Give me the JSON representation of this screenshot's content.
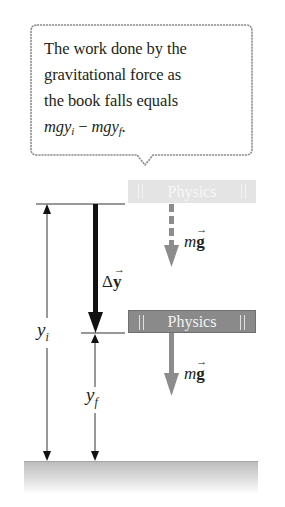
{
  "callout": {
    "line1": "The work done by the",
    "line2": "gravitational force as",
    "line3": "the book falls equals",
    "equation": {
      "term1": "mgy",
      "sub1": "i",
      "operator": " − ",
      "term2": "mgy",
      "sub2": "f",
      "end": "."
    }
  },
  "books": {
    "initial": {
      "label": "Physics",
      "state": "ghost/initial position"
    },
    "final": {
      "label": "Physics",
      "state": "final position"
    }
  },
  "labels": {
    "displacement": {
      "delta": "Δ",
      "var": "y",
      "arrow": "→"
    },
    "force_initial": {
      "m": "m",
      "g": "g",
      "arrow": "→"
    },
    "force_final": {
      "m": "m",
      "g": "g",
      "arrow": "→"
    },
    "yi": {
      "var": "y",
      "sub": "i"
    },
    "yf": {
      "var": "y",
      "sub": "f"
    }
  },
  "colors": {
    "text": "#231f20",
    "book_ghost": "#e4e4e4",
    "book_final": "#8a8a8a",
    "force_arrow": "#8c8c8c",
    "displacement_arrow": "#111111",
    "ground": "#c4c4c4"
  }
}
